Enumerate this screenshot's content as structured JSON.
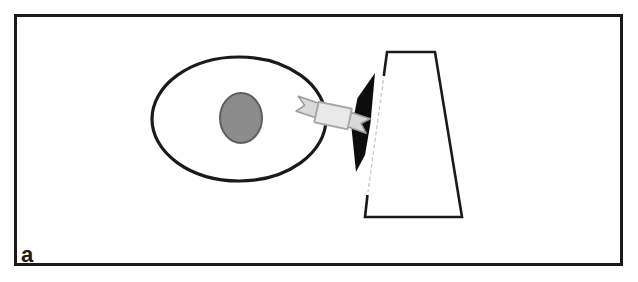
{
  "figure": {
    "panel_label": "a",
    "colors": {
      "background": "#ffffff",
      "frame": "#1a1a1a",
      "line": "#1a1a1a",
      "nucleus_fill": "#8c8c8c",
      "nucleus_stroke": "#5f5f5f",
      "wedge_fill": "#0d0d0d",
      "ribbon_fill": "#d9d9d9",
      "ribbon_stroke": "#9b9b9b",
      "ribbon_panel_fill": "#e9e9e9",
      "ribbon_panel_stroke": "#a8a8a8",
      "faint_edge": "#c9c9c9"
    }
  }
}
